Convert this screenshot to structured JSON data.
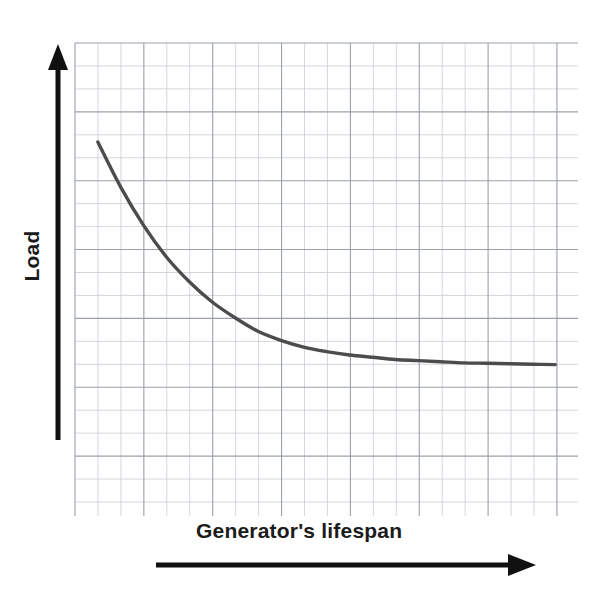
{
  "figure": {
    "background_color": "#ffffff",
    "grid_color": "#c9cdd4",
    "grid_major_color": "#9aa0a8",
    "curve_color": "#4c4c4c",
    "axis_color": "#111111",
    "label_color": "#1b1b1b"
  },
  "axes": {
    "y": {
      "label": "Load",
      "arrow_direction": "up",
      "name": "y-axis-arrow"
    },
    "x": {
      "label": "Generator's lifespan",
      "arrow_direction": "right",
      "name": "x-axis-arrow"
    }
  },
  "chart_data": {
    "type": "line",
    "title": "",
    "xlabel": "Generator's lifespan",
    "ylabel": "Load",
    "grid": true,
    "legend": null,
    "xlim": [
      0,
      22
    ],
    "ylim": [
      0,
      21
    ],
    "x": [
      1,
      2,
      3,
      4,
      5,
      6,
      7,
      8,
      9,
      10,
      11,
      12,
      13,
      14,
      15,
      16,
      17,
      18,
      19,
      20,
      21
    ],
    "series": [
      {
        "name": "Load vs lifespan",
        "values": [
          16.6,
          14.6,
          12.9,
          11.5,
          10.4,
          9.5,
          8.8,
          8.2,
          7.8,
          7.5,
          7.3,
          7.15,
          7.05,
          6.95,
          6.9,
          6.85,
          6.8,
          6.78,
          6.76,
          6.74,
          6.72
        ]
      }
    ]
  }
}
